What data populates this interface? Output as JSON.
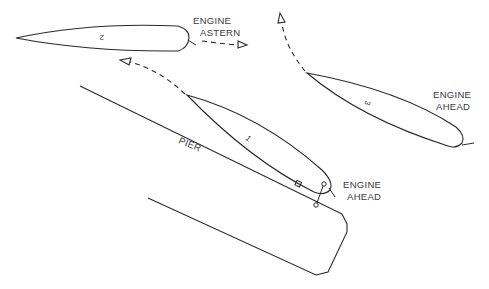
{
  "diagram": {
    "ships": [
      {
        "id": "1",
        "number_label": "1",
        "engine_label_line1": "ENGINE",
        "engine_label_line2": "AHEAD"
      },
      {
        "id": "2",
        "number_label": "2",
        "engine_label_line1": "ENGINE",
        "engine_label_line2": "ASTERN"
      },
      {
        "id": "3",
        "number_label": "3",
        "engine_label_line1": "ENGINE",
        "engine_label_line2": "AHEAD"
      }
    ],
    "pier_label": "PIER",
    "colors": {
      "line": "#2a2a2a",
      "text": "#3a3a3a",
      "background": "#ffffff"
    }
  }
}
